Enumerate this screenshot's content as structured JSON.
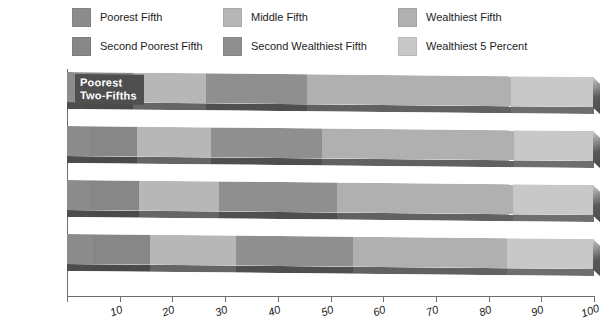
{
  "legend": {
    "items": [
      {
        "label": "Poorest Fifth",
        "color": "#8c8c8c",
        "key": "poorest_fifth"
      },
      {
        "label": "Second Poorest Fifth",
        "color": "#878787",
        "key": "second_poorest_fifth"
      },
      {
        "label": "Middle Fifth",
        "color": "#b7b7b7",
        "key": "middle_fifth"
      },
      {
        "label": "Second Wealthiest Fifth",
        "color": "#8f8f8f",
        "key": "second_wealthiest_fifth"
      },
      {
        "label": "Wealthiest Fifth",
        "color": "#b0b0b0",
        "key": "wealthiest_fifth"
      },
      {
        "label": "Wealthiest 5 Percent",
        "color": "#c8c8c8",
        "key": "wealthiest_5_percent"
      }
    ]
  },
  "annotation": {
    "text": "Poorest\nTwo-Fifths",
    "background": "#4f4f4f",
    "color": "#ffffff"
  },
  "chart_data": {
    "type": "bar",
    "orientation": "horizontal",
    "stacked": true,
    "stack_mode": "percent",
    "title": "",
    "subtitle": "",
    "xlabel": "",
    "ylabel": "",
    "xlim": [
      0,
      100
    ],
    "ylim": null,
    "grid": false,
    "legend_position": "top",
    "categories": [
      "1929",
      "1935–1936",
      "1941",
      "1944"
    ],
    "tick_values": [
      10,
      20,
      30,
      40,
      50,
      60,
      70,
      80,
      90,
      100
    ],
    "tick_labels": [
      "10",
      "20",
      "30",
      "40",
      "50",
      "60",
      "70",
      "80",
      "90",
      "100"
    ],
    "series": [
      {
        "name": "Poorest Fifth",
        "color": "#8c8c8c",
        "values": [
          3.5,
          4.1,
          4.1,
          4.9
        ]
      },
      {
        "name": "Second Poorest Fifth",
        "color": "#878787",
        "values": [
          9.0,
          9.2,
          9.5,
          10.9
        ]
      },
      {
        "name": "Middle Fifth",
        "color": "#b7b7b7",
        "values": [
          13.8,
          14.1,
          15.3,
          16.2
        ]
      },
      {
        "name": "Second Wealthiest Fifth",
        "color": "#8f8f8f",
        "values": [
          19.3,
          20.9,
          22.3,
          22.2
        ]
      },
      {
        "name": "Wealthiest Fifth",
        "color": "#b0b0b0",
        "values": [
          38.6,
          36.6,
          33.4,
          29.3
        ]
      },
      {
        "name": "Wealthiest 5 Percent",
        "color": "#c8c8c8",
        "values": [
          15.8,
          15.1,
          15.4,
          16.5
        ]
      }
    ],
    "annotations": [
      {
        "text": "Poorest Two-Fifths",
        "row": "1929",
        "spans_series": [
          "Poorest Fifth",
          "Second Poorest Fifth"
        ]
      }
    ]
  }
}
